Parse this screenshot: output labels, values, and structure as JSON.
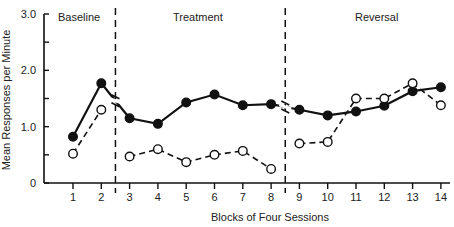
{
  "chart_data": {
    "type": "line",
    "title": "",
    "xlabel": "Blocks of Four Sessions",
    "ylabel": "Mean Responses per Minute",
    "ylim": [
      0,
      3.0
    ],
    "yticks": [
      "0",
      "1.0",
      "2.0",
      "3.0"
    ],
    "x": [
      1,
      2,
      3,
      4,
      5,
      6,
      7,
      8,
      9,
      10,
      11,
      12,
      13,
      14
    ],
    "phases": [
      {
        "label": "Baseline",
        "blocks": [
          1,
          2
        ]
      },
      {
        "label": "Treatment",
        "blocks": [
          3,
          4,
          5,
          6,
          7,
          8
        ]
      },
      {
        "label": "Reversal",
        "blocks": [
          9,
          10,
          11,
          12,
          13,
          14
        ]
      }
    ],
    "series": [
      {
        "name": "filled-circle-solid-line",
        "marker": "filled",
        "line": "solid",
        "values": [
          0.82,
          1.77,
          1.15,
          1.05,
          1.43,
          1.57,
          1.38,
          1.4,
          1.3,
          1.2,
          1.27,
          1.37,
          1.63,
          1.7
        ]
      },
      {
        "name": "open-circle-dashed-line",
        "marker": "open",
        "line": "dashed",
        "values": [
          0.52,
          1.3,
          0.47,
          0.6,
          0.37,
          0.5,
          0.57,
          0.25,
          0.7,
          0.73,
          1.5,
          1.5,
          1.77,
          1.38
        ]
      }
    ],
    "grid": false,
    "legend": "none"
  }
}
